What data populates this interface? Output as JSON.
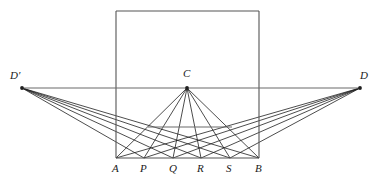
{
  "figure": {
    "background_color": "#ffffff",
    "width": 376,
    "height": 184
  },
  "styles": {
    "frame_color": "#555555",
    "horizon_color": "#6a6a6a",
    "fan_color": "#1f1f1f",
    "transversal_color": "#6a6a6a",
    "frame_width": 1.1,
    "horizon_width": 1.1,
    "fan_width": 0.8
  },
  "points": {
    "D_prime": {
      "label": "D′",
      "x": 22,
      "y": 88,
      "label_x": 10,
      "label_y": 70
    },
    "D": {
      "label": "D",
      "x": 360,
      "y": 88,
      "label_x": 360,
      "label_y": 70
    },
    "C": {
      "label": "C",
      "x": 187,
      "y": 88,
      "label_x": 183,
      "label_y": 68
    },
    "A": {
      "label": "A",
      "x": 116,
      "y": 158,
      "label_x": 112,
      "label_y": 163
    },
    "P": {
      "label": "P",
      "x": 144,
      "y": 158,
      "label_x": 140,
      "label_y": 163
    },
    "Q": {
      "label": "Q",
      "x": 173,
      "y": 158,
      "label_x": 169,
      "label_y": 163
    },
    "R": {
      "label": "R",
      "x": 201,
      "y": 158,
      "label_x": 197,
      "label_y": 163
    },
    "S": {
      "label": "S",
      "x": 230,
      "y": 158,
      "label_x": 226,
      "label_y": 163
    },
    "B": {
      "label": "B",
      "x": 259,
      "y": 158,
      "label_x": 255,
      "label_y": 163
    }
  },
  "chart_data": {
    "type": "diagram",
    "square": {
      "left": 116,
      "top": 11,
      "right": 259,
      "bottom": 158
    },
    "horizon_line": {
      "x1": 22,
      "y1": 88,
      "x2": 360,
      "y2": 88
    },
    "baseline": {
      "x1": 116,
      "y1": 158,
      "x2": 259,
      "y2": 158
    },
    "baseline_points": [
      {
        "name": "A",
        "x": 116
      },
      {
        "name": "P",
        "x": 144
      },
      {
        "name": "Q",
        "x": 173
      },
      {
        "name": "R",
        "x": 201
      },
      {
        "name": "S",
        "x": 230
      },
      {
        "name": "B",
        "x": 259
      }
    ],
    "transversal": {
      "x1": 148,
      "y1": 127,
      "x2": 232,
      "y2": 127
    },
    "fans": [
      {
        "apex": "C",
        "apex_x": 187,
        "apex_y": 88,
        "targets": [
          116,
          144,
          173,
          201,
          230,
          259
        ]
      },
      {
        "apex": "D_prime",
        "apex_x": 22,
        "apex_y": 88,
        "targets": [
          144,
          173,
          201,
          230,
          259
        ]
      },
      {
        "apex": "D",
        "apex_x": 360,
        "apex_y": 88,
        "targets": [
          116,
          144,
          173,
          201,
          230
        ]
      }
    ]
  }
}
